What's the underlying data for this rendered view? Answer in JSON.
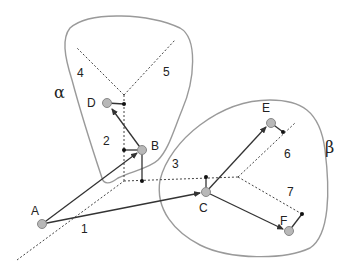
{
  "diagram": {
    "regions": [
      {
        "id": "alpha",
        "label": "α"
      },
      {
        "id": "beta",
        "label": "β"
      }
    ],
    "nodes": [
      {
        "id": "A",
        "label": "A"
      },
      {
        "id": "B",
        "label": "B"
      },
      {
        "id": "C",
        "label": "C"
      },
      {
        "id": "D",
        "label": "D"
      },
      {
        "id": "E",
        "label": "E"
      },
      {
        "id": "F",
        "label": "F"
      }
    ],
    "cell_numbers": [
      "1",
      "2",
      "3",
      "4",
      "5",
      "6",
      "7"
    ],
    "edges": [
      {
        "from": "A",
        "to": "B"
      },
      {
        "from": "A",
        "to": "C"
      },
      {
        "from": "B",
        "to": "D"
      },
      {
        "from": "C",
        "to": "E"
      },
      {
        "from": "C",
        "to": "F"
      }
    ],
    "colors": {
      "region_outline": "#9a9a9a",
      "node_fill": "#b8b8b8",
      "node_stroke": "#888888",
      "edge": "#333333",
      "dashed": "#444444"
    }
  }
}
